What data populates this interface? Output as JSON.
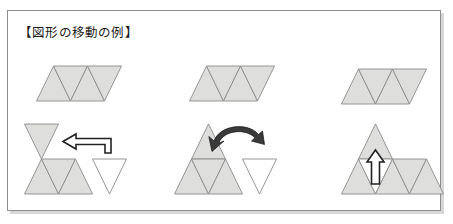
{
  "document": {
    "title": "【図形の移動の例】",
    "background_color": "#ffffff",
    "frame_border_color": "#8d8d8d"
  },
  "palette": {
    "shape_fill": "#dededd",
    "shape_stroke": "#8b8b8b",
    "white_fill": "#ffffff",
    "arrow_stroke": "#222222",
    "arc_arrow_fill": "#3a3a3a",
    "text_color": "#1a1a1a"
  },
  "examples": [
    {
      "id": "translation",
      "column": "left",
      "before_label": "parallelogram-of-four-triangles",
      "after_label": "translated-shape",
      "arrow": "straight-left-elbow-arrow",
      "moved_piece": "white-down-triangle"
    },
    {
      "id": "rotation",
      "column": "middle",
      "before_label": "parallelogram-of-four-triangles",
      "after_label": "rotated-shape",
      "arrow": "curved-rotation-arrow",
      "moved_piece": "white-down-triangle"
    },
    {
      "id": "reflection",
      "column": "right",
      "before_label": "parallelogram-of-four-triangles",
      "after_label": "reflected-shape",
      "arrow": "straight-up-arrow",
      "moved_piece": "white-down-triangle"
    }
  ],
  "shapes": {
    "top_row": {
      "name": "parallelogram-row",
      "description": "Parallelogram composed of four equilateral triangles: up, down, up, down",
      "triangle_count": 4,
      "instances": [
        "top-left",
        "top-middle",
        "top-right"
      ]
    },
    "bottom_left": {
      "name": "translation-result",
      "description": "Inverted triangle moved up-left, row of three gray triangles, one white inverted triangle on right"
    },
    "bottom_middle": {
      "name": "rotation-result",
      "description": "Large triangle of four small triangles with curved arrow, white inverted triangle on right"
    },
    "bottom_right": {
      "name": "reflection-result",
      "description": "Up triangle on top with up arrow, bottom row of triangles with white inverted triangle"
    }
  }
}
